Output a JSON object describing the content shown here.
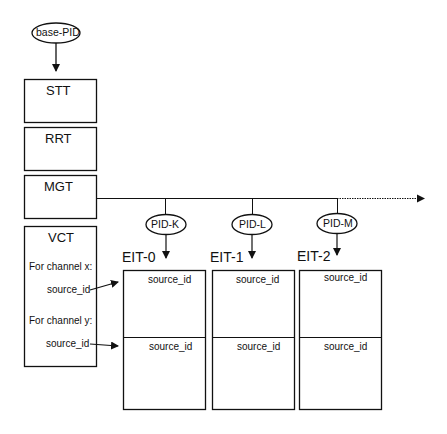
{
  "diagram": {
    "root": {
      "label": "base-PID"
    },
    "tables": [
      {
        "id": "stt",
        "label": "STT"
      },
      {
        "id": "rrt",
        "label": "RRT"
      },
      {
        "id": "mgt",
        "label": "MGT"
      }
    ],
    "vct": {
      "label": "VCT",
      "channels": [
        {
          "label": "For channel x:",
          "field": "source_id"
        },
        {
          "label": "For channel y:",
          "field": "source_id"
        }
      ]
    },
    "pids": [
      {
        "label": "PID-K",
        "eit": "EIT-0"
      },
      {
        "label": "PID-L",
        "eit": "EIT-1"
      },
      {
        "label": "PID-M",
        "eit": "EIT-2"
      }
    ],
    "eit_tables": [
      {
        "label": "EIT-0",
        "rows": [
          "source_id",
          "source_id"
        ]
      },
      {
        "label": "EIT-1",
        "rows": [
          "source_id",
          "source_id"
        ]
      },
      {
        "label": "EIT-2",
        "rows": [
          "source_id",
          "source_id"
        ]
      }
    ],
    "colors": {
      "stroke": "#111111",
      "background": "#ffffff"
    }
  }
}
